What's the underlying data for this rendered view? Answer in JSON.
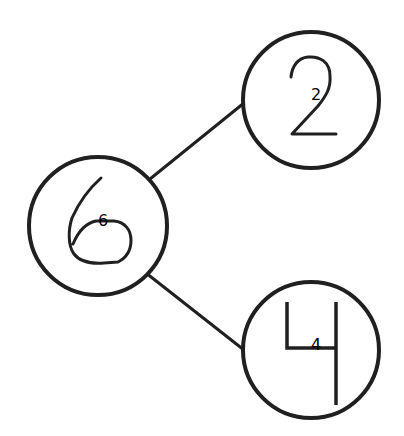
{
  "diagram": {
    "type": "tree",
    "colors": {
      "stroke": "#202020",
      "background": "#ffffff"
    },
    "nodes": [
      {
        "id": "n6",
        "label": "6",
        "cx": 98,
        "cy": 226,
        "r": 69,
        "role": "root"
      },
      {
        "id": "n2",
        "label": "2",
        "cx": 311,
        "cy": 100,
        "r": 68,
        "role": "child"
      },
      {
        "id": "n4",
        "label": "4",
        "cx": 311,
        "cy": 350,
        "r": 68,
        "role": "child"
      }
    ],
    "edges": [
      {
        "from": "6",
        "to": "2"
      },
      {
        "from": "6",
        "to": "4"
      }
    ]
  }
}
